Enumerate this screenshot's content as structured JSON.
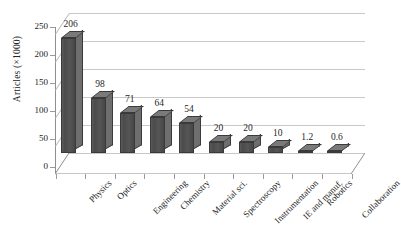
{
  "chart_data": {
    "type": "bar",
    "title": "",
    "xlabel": "",
    "ylabel": "Articles (×1000)",
    "ylim": [
      0,
      250
    ],
    "ytick_labels": [
      "0",
      "50",
      "100",
      "150",
      "200",
      "250"
    ],
    "ytick_values": [
      0,
      50,
      100,
      150,
      200,
      250
    ],
    "grid": true,
    "legend": "none",
    "style": "3d-column",
    "categories": [
      "Physics",
      "Optics",
      "Engineering",
      "Chemistry",
      "Material sci.",
      "Spectroscopy",
      "Instrumentation",
      "IE and manuf.",
      "Robotics",
      "Collaboration"
    ],
    "values": [
      206,
      98,
      71,
      64,
      54,
      20,
      20,
      10,
      1.2,
      0.6
    ],
    "data_labels": [
      "206",
      "98",
      "71",
      "64",
      "54",
      "20",
      "20",
      "10",
      "1.2",
      "0.6"
    ],
    "colors": {
      "bar_front": "#4b4b4b",
      "bar_side": "#6e6e6e",
      "bar_top": "#7a7a7a",
      "bar_outline": "#3a3a3a",
      "gridline": "#c9c9c9",
      "axis": "#8f8f8f",
      "background": "#ffffff",
      "text": "#222222"
    }
  }
}
